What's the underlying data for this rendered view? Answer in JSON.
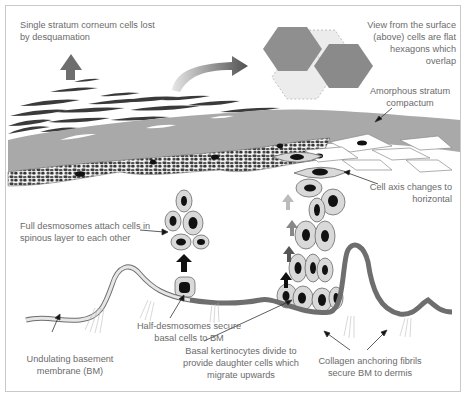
{
  "diagram": {
    "labels": {
      "desquamation": "Single stratum corneum cells lost\nby desquamation",
      "surface_view": "View from the surface\n(above) cells are flat\nhexagons which\noverlap",
      "compactum": "Amorphous stratum\ncompactum",
      "cell_axis": "Cell axis changes to\nhorizontal",
      "full_desmosomes": "Full desmosomes attach cells in\nspinous layer to each other",
      "half_desmosomes": "Half-desmosomes secure\nbasal cells to BM",
      "basal_keratinocytes": "Basal kertinocytes divide to\nprovide daughter cells which\nmigrate upwards",
      "basement_membrane": "Undulating basement\nmembrane (BM)",
      "collagen_fibrils": "Collagen anchoring fibrils\nsecure BM to dermis"
    },
    "colors": {
      "text": "#6b6b6b",
      "stratum_corneum_flakes": "#3a3a3a",
      "compactum_band": "#a9a9a9",
      "granular_layer": "#4a4a4a",
      "cell_fill": "#d9d9d9",
      "nucleus": "#111111",
      "basement_membrane": "#6e6e6e",
      "hexagon_dark": "#8c8c8c",
      "hexagon_light": "#e3e3e3"
    }
  }
}
